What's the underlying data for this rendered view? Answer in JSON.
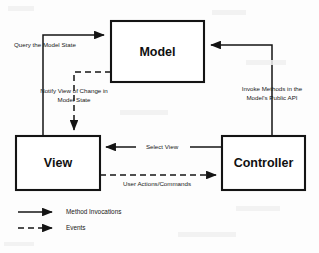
{
  "diagram": {
    "type": "mvc-architecture-diagram",
    "colors": {
      "background": "#fdfdfd",
      "stroke": "#141414",
      "box_fill": "#ffffff",
      "text": "#101010"
    },
    "nodes": [
      {
        "id": "model",
        "label": "Model",
        "x": 111,
        "y": 21,
        "width": 93,
        "height": 61
      },
      {
        "id": "view",
        "label": "View",
        "x": 16,
        "y": 136,
        "width": 84,
        "height": 54
      },
      {
        "id": "controller",
        "label": "Controller",
        "x": 222,
        "y": 136,
        "width": 83,
        "height": 54
      }
    ],
    "edges": [
      {
        "id": "query-model-state",
        "label": "Query the Model State",
        "from": "view",
        "to": "model",
        "style": "solid",
        "kind": "method-invocation",
        "label_x": 14,
        "label_y": 45
      },
      {
        "id": "notify-view-of-change",
        "label_line_1": "Notify View of Change in",
        "label_line_2": "Model State",
        "from": "model",
        "to": "view",
        "style": "dashed",
        "kind": "event",
        "label_x": 74,
        "label_y": 93
      },
      {
        "id": "invoke-methods-model-api",
        "label_line_1": "Invoke Methods in the",
        "label_line_2": "Model's Public API",
        "from": "controller",
        "to": "model",
        "style": "solid",
        "kind": "method-invocation",
        "label_x": 272,
        "label_y": 92
      },
      {
        "id": "select-view",
        "label": "Select View",
        "from": "controller",
        "to": "view",
        "style": "solid",
        "kind": "method-invocation",
        "label_x": 162,
        "label_y": 146
      },
      {
        "id": "user-actions-commands",
        "label": "User Actions/Commands",
        "from": "view",
        "to": "controller",
        "style": "dashed",
        "kind": "event",
        "label_x": 157,
        "label_y": 184
      }
    ],
    "legend": {
      "items": [
        {
          "id": "method-invocations",
          "label": "Method Invocations",
          "style": "solid",
          "y": 212
        },
        {
          "id": "events",
          "label": "Events",
          "style": "dashed",
          "y": 228
        }
      ]
    }
  }
}
